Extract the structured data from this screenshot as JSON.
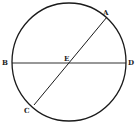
{
  "diagram": {
    "type": "geometric-figure",
    "stroke_color": "#1a1a1a",
    "circle": {
      "cx": 69,
      "cy": 62,
      "rx": 57,
      "ry": 59
    },
    "lines": [
      {
        "name": "diameter-BD",
        "from": "B",
        "to": "D",
        "x1": 12,
        "y1": 63,
        "x2": 126,
        "y2": 63
      },
      {
        "name": "diameter-AC",
        "from": "A",
        "to": "C",
        "x1": 107,
        "y1": 17,
        "x2": 34,
        "y2": 105
      }
    ],
    "labels": {
      "A": "A",
      "B": "B",
      "C": "C",
      "D": "D",
      "E": "E"
    }
  }
}
